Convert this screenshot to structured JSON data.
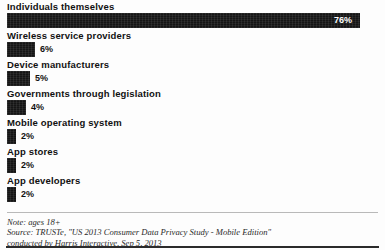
{
  "chart_data": {
    "type": "bar",
    "orientation": "horizontal",
    "title": "",
    "subtitle": "",
    "xlabel": "",
    "ylabel": "",
    "xlim": [
      0,
      80
    ],
    "grid": false,
    "legend": null,
    "value_suffix": "%",
    "categories": [
      "Individuals themselves",
      "Wireless service providers",
      "Device manufacturers",
      "Governments through legislation",
      "Mobile operating system",
      "App stores",
      "App developers"
    ],
    "values": [
      76,
      6,
      5,
      4,
      2,
      2,
      2
    ],
    "value_labels": [
      "76%",
      "6%",
      "5%",
      "4%",
      "2%",
      "2%",
      "2%"
    ],
    "label_placement": [
      "inside",
      "outside",
      "outside",
      "outside",
      "outside",
      "outside",
      "outside"
    ],
    "bar_color": "#151515",
    "inside_label_color": "#ffffff",
    "outside_label_color": "#111111"
  },
  "footer": {
    "note": "Note: ages 18+",
    "source_line_1": "Source: TRUSTe, \"US 2013 Consumer Data Privacy Study - Mobile Edition\"",
    "source_line_2": "conducted by Harris Interactive, Sep 5, 2013"
  }
}
